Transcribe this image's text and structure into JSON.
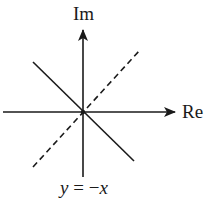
{
  "diagram": {
    "type": "complex-plane",
    "axes": {
      "vertical_label": "Im",
      "horizontal_label": "Re"
    },
    "lines": [
      {
        "name": "solid-line",
        "style": "solid",
        "equation": "y = −x",
        "from": [
          33,
          62
        ],
        "to": [
          134,
          161
        ]
      },
      {
        "name": "dashed-line",
        "style": "dashed",
        "from": [
          33,
          167
        ],
        "to": [
          140,
          50
        ]
      }
    ],
    "caption": {
      "var": "y",
      "eq": " = ",
      "rhs_sign": "−",
      "rhs_var": "x"
    },
    "colors": {
      "stroke": "#1a1a1a",
      "background": "#ffffff"
    }
  }
}
